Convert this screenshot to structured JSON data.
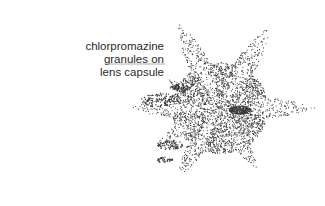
{
  "figure": {
    "annotation": {
      "lines": [
        "chlorpromazine",
        "granules on",
        "lens capsule"
      ]
    },
    "shape": "stellate stippled pattern",
    "colors": {
      "dots": "#3a3a3a",
      "leader_line": "#9a9a9a",
      "background": "#ffffff"
    }
  }
}
